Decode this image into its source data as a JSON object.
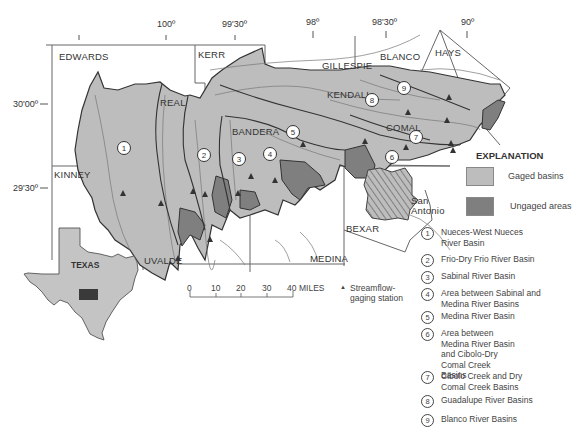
{
  "map": {
    "longitude_ticks": [
      "100º",
      "99'30º",
      "98º",
      "98'30º",
      "90º"
    ],
    "latitude_ticks": [
      "30'00º",
      "29'30º"
    ],
    "counties": [
      "EDWARDS",
      "KERR",
      "GILLESPIE",
      "BLANCO",
      "HAYS",
      "REAL",
      "BANDERA",
      "KENDALL",
      "COMAL",
      "KINNEY",
      "UVALDE",
      "MEDINA",
      "BEXAR"
    ],
    "city": [
      "San",
      "Antonio"
    ],
    "inset_label": "TEXAS",
    "basin_markers": [
      "1",
      "2",
      "3",
      "4",
      "5",
      "6",
      "7",
      "8",
      "9"
    ]
  },
  "colors": {
    "gaged": "#bdbdbd",
    "ungaged": "#7f7f7f",
    "outline": "#444444",
    "inset_fill": "#c4c4c4",
    "inset_study_area": "#3a3a3a"
  },
  "scale": {
    "ticks": [
      "0",
      "10",
      "20",
      "30",
      "40"
    ],
    "unit": "MILES"
  },
  "station_legend": {
    "symbol": "▲",
    "label_line1": "Streamflow-",
    "label_line2": "gaging station"
  },
  "explanation": {
    "title": "EXPLANATION",
    "swatches": [
      {
        "label": "Gaged basins"
      },
      {
        "label": "Ungaged areas"
      }
    ],
    "basins": [
      {
        "num": "1",
        "label": "Nueces-West Nueces River Basin"
      },
      {
        "num": "2",
        "label": "Frio-Dry Frio River Basin"
      },
      {
        "num": "3",
        "label": "Sabinal River Basin"
      },
      {
        "num": "4",
        "label": "Area between Sabinal and Medina River Basins"
      },
      {
        "num": "5",
        "label": "Medina River Basin"
      },
      {
        "num": "6",
        "label": "Area between Medina River Basin and Cibolo-Dry Comal Creek Basins"
      },
      {
        "num": "7",
        "label": "Cibolo Creek and Dry Comal Creek Basins"
      },
      {
        "num": "8",
        "label": "Guadalupe River Basins"
      },
      {
        "num": "9",
        "label": "Blanco River Basins"
      }
    ]
  }
}
